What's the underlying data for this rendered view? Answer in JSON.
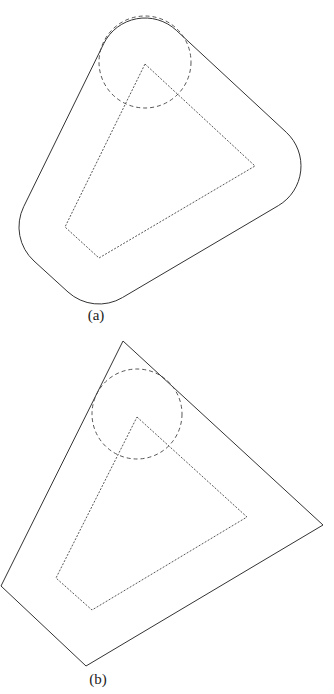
{
  "figure_a": {
    "label": "(a)",
    "description": "Polygon offset with rounded corners (Minkowski sum with disk)",
    "inner_polygon": [
      [
        145,
        64
      ],
      [
        255,
        166
      ],
      [
        99,
        258
      ],
      [
        65,
        227
      ]
    ],
    "circle": {
      "cx": 145,
      "cy": 62,
      "r": 46
    },
    "outer_path": "M176.3,30.3 L286.3,132.3 A46 46 0 0 1 278.4,205.6 L122.4,297.6 A46 46 0 0 1 68,292 L34,261 A46 46 0 0 1 23.7,206.7 L103.7,43.7 A46 46 0 0 1 176.3,30.3 Z"
  },
  "figure_b": {
    "label": "(b)",
    "description": "Polygon offset with sharp corners",
    "inner_polygon": [
      [
        137,
        417
      ],
      [
        247,
        517
      ],
      [
        92,
        610
      ],
      [
        56,
        578
      ]
    ],
    "circle": {
      "cx": 137,
      "cy": 414,
      "r": 45
    },
    "outer_polygon": [
      [
        123,
        341
      ],
      [
        323,
        525
      ],
      [
        86,
        666
      ],
      [
        1,
        586
      ]
    ]
  },
  "colors": {
    "stroke": "#333333",
    "background": "#ffffff"
  }
}
